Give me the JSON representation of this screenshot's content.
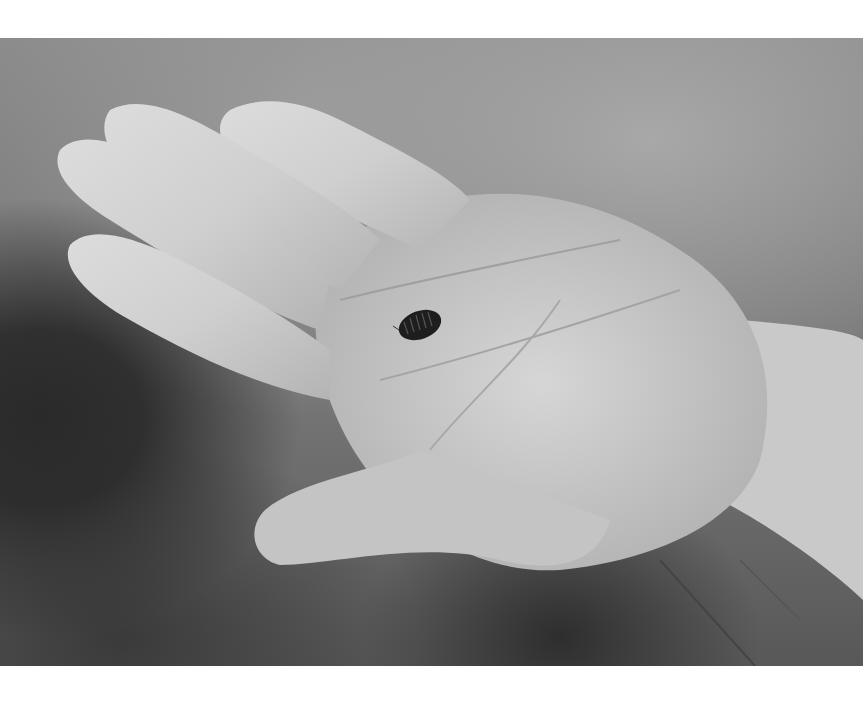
{
  "image": {
    "description": "Black-and-white photograph of an open child's hand, palm up, holding a small pill bug (woodlouse) in the center of the palm, against a blurred grey background.",
    "subject": "hand-holding-pill-bug",
    "palette": {
      "background": "#ffffff",
      "hand_light": "#d8d8d8",
      "hand_shadow": "#9a9a9a",
      "bug": "#1e1e1e",
      "bg_dark": "#2a2a2a",
      "bg_light": "#a8a8a8"
    }
  }
}
